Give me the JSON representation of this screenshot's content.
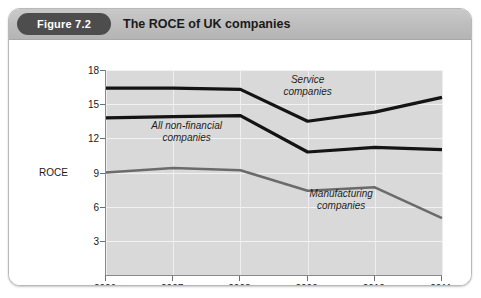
{
  "header": {
    "badge": "Figure 7.2",
    "title": "The ROCE of UK companies"
  },
  "chart_data": {
    "type": "line",
    "title": "The ROCE of UK companies",
    "xlabel": "",
    "ylabel": "ROCE",
    "categories": [
      "2006",
      "2007",
      "2008",
      "2009",
      "2010",
      "2011"
    ],
    "x": [
      2006,
      2007,
      2008,
      2009,
      2010,
      2011
    ],
    "xlim": [
      2006,
      2011
    ],
    "ylim": [
      0,
      18
    ],
    "yticks": [
      3,
      6,
      9,
      12,
      15,
      18
    ],
    "ytick_labels": [
      "3",
      "6",
      "9",
      "12",
      "15",
      "18"
    ],
    "grid": true,
    "legend": "inline-annotations",
    "series": [
      {
        "name": "Service companies",
        "values": [
          16.4,
          16.4,
          16.3,
          13.5,
          14.3,
          15.6
        ],
        "color": "#141414",
        "width": 3.2
      },
      {
        "name": "All non-financial companies",
        "values": [
          13.8,
          13.9,
          14.0,
          10.8,
          11.2,
          11.0
        ],
        "color": "#141414",
        "width": 3.2
      },
      {
        "name": "Manufacturing companies",
        "values": [
          9.0,
          9.4,
          9.2,
          7.4,
          7.7,
          5.0
        ],
        "color": "#6b6b6b",
        "width": 2.6
      }
    ],
    "annotations": [
      {
        "text_line1": "Service",
        "text_line2": "companies",
        "x": 2009.0,
        "y": 16.6
      },
      {
        "text_line1": "All non-financial",
        "text_line2": "companies",
        "x": 2007.2,
        "y": 12.6
      },
      {
        "text_line1": "Manufacturing",
        "text_line2": "companies",
        "x": 2009.5,
        "y": 6.6
      }
    ],
    "colors": {
      "plot_background": "#d9d9d9",
      "gridline": "#f2f2f2",
      "axis": "#8a8a8a",
      "header_badge": "#4d4d4d"
    }
  }
}
